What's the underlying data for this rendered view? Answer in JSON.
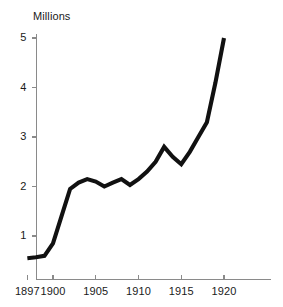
{
  "chart_data": {
    "type": "line",
    "title": "Millions",
    "xlabel": "",
    "ylabel": "",
    "grid": false,
    "legend": false,
    "legend_position": "none",
    "line_color": "#111111",
    "axis_color": "#8a8a8a",
    "background_color": "#ffffff",
    "xlim": [
      1896,
      1923
    ],
    "ylim": [
      0,
      5.35
    ],
    "xticks": [
      1897,
      1900,
      1905,
      1910,
      1915,
      1920
    ],
    "xtick_labels": [
      "1897",
      "1900",
      "1905",
      "1910",
      "1915",
      "1920"
    ],
    "yticks": [
      1,
      2,
      3,
      4,
      5
    ],
    "ytick_labels": [
      "1",
      "2",
      "3",
      "4",
      "5"
    ],
    "x": [
      1897,
      1898,
      1899,
      1900,
      1901,
      1902,
      1903,
      1904,
      1905,
      1906,
      1907,
      1908,
      1909,
      1910,
      1911,
      1912,
      1913,
      1914,
      1915,
      1916,
      1917,
      1918,
      1919,
      1920
    ],
    "values": [
      0.55,
      0.57,
      0.6,
      0.85,
      1.4,
      1.95,
      2.08,
      2.15,
      2.1,
      2.0,
      2.08,
      2.15,
      2.03,
      2.15,
      2.3,
      2.5,
      2.8,
      2.6,
      2.45,
      2.7,
      3.0,
      3.3,
      4.1,
      5.0
    ],
    "series": [
      {
        "name": "Millions",
        "values": [
          0.55,
          0.57,
          0.6,
          0.85,
          1.4,
          1.95,
          2.08,
          2.15,
          2.1,
          2.0,
          2.08,
          2.15,
          2.03,
          2.15,
          2.3,
          2.5,
          2.8,
          2.6,
          2.45,
          2.7,
          3.0,
          3.3,
          4.1,
          5.0
        ]
      }
    ]
  }
}
